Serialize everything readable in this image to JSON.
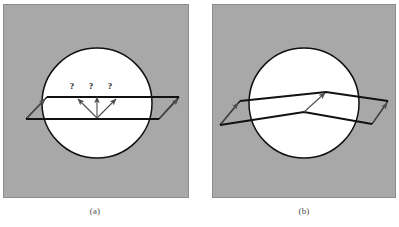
{
  "figure": {
    "background_color": "#ffffff",
    "panel_fill": "#a8a8a8",
    "panel_border_color": "#8f8f8f",
    "circle_fill": "#ffffff",
    "line_color": "#111111",
    "arrow_color": "#4d4d4d",
    "caption_color": "#4a4a4a"
  },
  "panels": [
    {
      "id": "panel-a",
      "caption": "(a)",
      "x": 3,
      "y": 4,
      "width": 186,
      "height": 194,
      "circle": {
        "cx": 94,
        "cy": 99,
        "r": 55
      },
      "description": "Plane wavefronts crossing a circular region, with three question-mark rays",
      "question_marks": [
        "?",
        "?",
        "?"
      ],
      "ray_count": 3
    },
    {
      "id": "panel-b",
      "caption": "(b)",
      "x": 212,
      "y": 4,
      "width": 184,
      "height": 194,
      "circle": {
        "cx": 92,
        "cy": 99,
        "r": 55
      },
      "description": "Refracted bent wavefronts crossing a circular region, with a single ray",
      "question_marks": [],
      "ray_count": 1
    }
  ]
}
